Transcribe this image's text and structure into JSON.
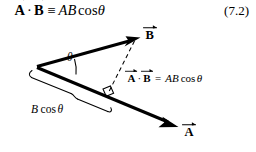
{
  "figure": {
    "equation": {
      "lhs_vector_a": "A",
      "dot_operator": "·",
      "lhs_vector_b": "B",
      "relation": "≡",
      "rhs_magnitude_a": "A",
      "rhs_magnitude_b": "B",
      "rhs_function": "cos",
      "rhs_angle": "θ",
      "number": "(7.2)"
    },
    "diagram": {
      "vector_b_label": "B",
      "vector_a_label": "A",
      "angle_label": "θ",
      "projection_label_magnitude": "B",
      "projection_label_function": "cos",
      "projection_label_angle": "θ",
      "inline_result": {
        "vector_a": "A",
        "dot_operator": "·",
        "vector_b": "B",
        "equals": "=",
        "magnitude_a": "A",
        "magnitude_b": "B",
        "function": "cos",
        "angle": "θ"
      }
    },
    "colors": {
      "ink": "#000000",
      "background": "#ffffff"
    }
  }
}
